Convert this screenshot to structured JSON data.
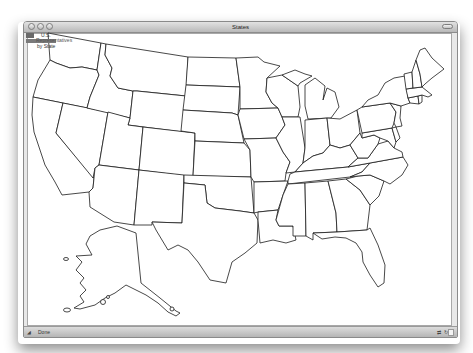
{
  "window": {
    "title": "States",
    "traffic_lights": [
      "close",
      "minimize",
      "zoom"
    ],
    "toolbar_toggle_icon": "toolbar-pill-icon"
  },
  "legend": {
    "line1": "U.S.",
    "line2": "Representatives",
    "line3": "by State"
  },
  "statusbar": {
    "status_text": "Done",
    "left_icon": "resize-grip-icon",
    "right_icons": [
      "network-icon",
      "refresh-icon",
      "page-icon"
    ]
  },
  "map": {
    "subject": "United States outline map",
    "fill_color": "#ffffff",
    "stroke_color": "#1a1a1a",
    "states": [
      "WA",
      "OR",
      "CA",
      "NV",
      "ID",
      "MT",
      "WY",
      "UT",
      "AZ",
      "CO",
      "NM",
      "ND",
      "SD",
      "NE",
      "KS",
      "OK",
      "TX",
      "MN",
      "IA",
      "MO",
      "AR",
      "LA",
      "WI",
      "IL",
      "MI",
      "IN",
      "OH",
      "KY",
      "TN",
      "MS",
      "AL",
      "GA",
      "FL",
      "SC",
      "NC",
      "VA",
      "WV",
      "PA",
      "NY",
      "VT",
      "NH",
      "ME",
      "MA",
      "CT",
      "RI",
      "NJ",
      "DE",
      "MD",
      "AK"
    ]
  }
}
